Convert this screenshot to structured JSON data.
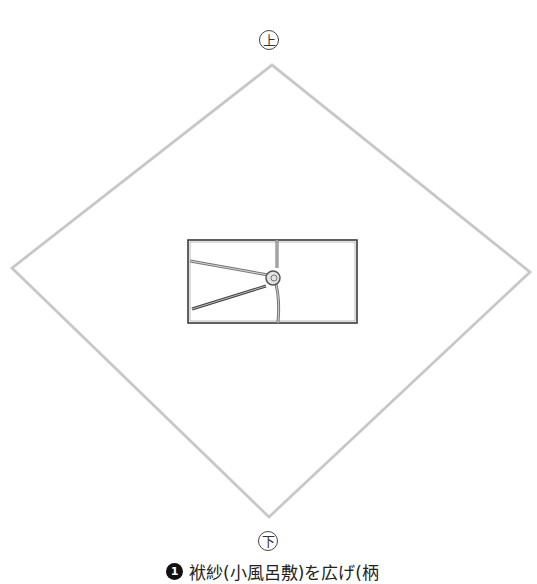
{
  "labels": {
    "top": "上",
    "bottom": "下"
  },
  "caption": {
    "step_number": "1",
    "text": "袱紗(小風呂敷)を広げ(柄"
  },
  "colors": {
    "cloth_edge": "#c8c8c8",
    "envelope_edge": "#333333",
    "cord": "#888888"
  },
  "icons": {
    "cloth": "diamond-cloth-icon",
    "envelope": "noshi-envelope-icon"
  }
}
